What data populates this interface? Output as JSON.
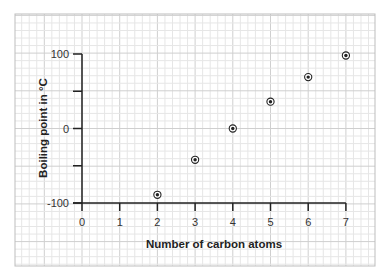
{
  "chart_data": {
    "type": "scatter",
    "title": "",
    "xlabel": "Number of carbon atoms",
    "ylabel": "Boiling point in °C",
    "x": [
      2,
      3,
      4,
      5,
      6,
      7
    ],
    "series": [
      {
        "name": "Boiling point",
        "values": [
          -89,
          -42,
          0,
          36,
          69,
          98
        ]
      }
    ],
    "xlim": [
      0,
      7
    ],
    "ylim": [
      -100,
      100
    ],
    "x_ticks": [
      "0",
      "1",
      "2",
      "3",
      "4",
      "5",
      "6",
      "7"
    ],
    "y_ticks": [
      "100",
      "0",
      "-100"
    ],
    "y_minor_ticks": [
      50,
      -50
    ],
    "grid": true,
    "legend": "none",
    "colors": {
      "grid_minor": "#e6e6e6",
      "grid_major": "#cfcfcf",
      "axis": "#222222",
      "marker": "#222222"
    }
  }
}
